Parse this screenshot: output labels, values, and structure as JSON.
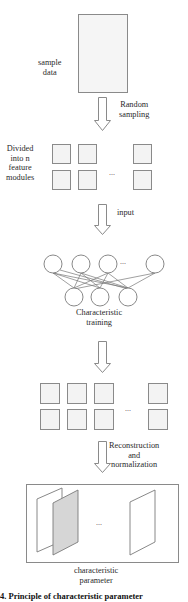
{
  "figure": {
    "steps": {
      "sample_data": {
        "label_line1": "sample",
        "label_line2": "data"
      },
      "arrow1": {
        "label_line1": "Random",
        "label_line2": "sampling"
      },
      "modules": {
        "label_line1": "Divided",
        "label_line2": "into n",
        "label_line3": "feature",
        "label_line4": "modules",
        "ellipsis": "..."
      },
      "arrow2": {
        "label": "input"
      },
      "network": {
        "label_line1": "Characteristic",
        "label_line2": "training",
        "ellipsis": "..."
      },
      "arrow3": {
        "label": ""
      },
      "grid2": {
        "ellipsis": "..."
      },
      "arrow4": {
        "label_line1": "Reconstruction",
        "label_line2": "and",
        "label_line3": "normalization"
      },
      "params": {
        "label_line1": "characteristic",
        "label_line2": "parameter",
        "ellipsis": "..."
      }
    },
    "caption_fragment": "4.  Principle of characteristic parameter",
    "colors": {
      "stroke": "#8a8a8a",
      "fill_light": "#f4f4f4",
      "fill_shaded": "#d4d4d4"
    },
    "network_layers": {
      "top_nodes": 4,
      "bottom_nodes": 3
    }
  }
}
